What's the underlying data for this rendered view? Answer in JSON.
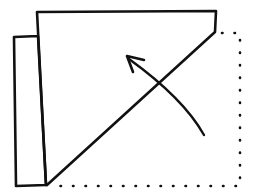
{
  "diagram": {
    "title": "",
    "colors": {
      "stroke": "#111111",
      "background": "#ffffff"
    },
    "elements": {
      "folded_flap": {
        "points": [
          [
            37,
            12
          ],
          [
            216,
            11
          ],
          [
            215,
            32
          ],
          [
            47,
            185
          ]
        ]
      },
      "side_strip": {
        "points": [
          [
            14,
            37
          ],
          [
            38,
            36
          ],
          [
            46,
            185
          ],
          [
            16,
            186
          ]
        ]
      },
      "dotted_outline": {
        "points": [
          [
            215,
            32
          ],
          [
            240,
            33
          ],
          [
            240,
            186
          ],
          [
            47,
            186
          ]
        ]
      },
      "fold_arrow": {
        "start": [
          204,
          135
        ],
        "control": [
          170,
          80
        ],
        "end": [
          127,
          57
        ]
      }
    }
  }
}
